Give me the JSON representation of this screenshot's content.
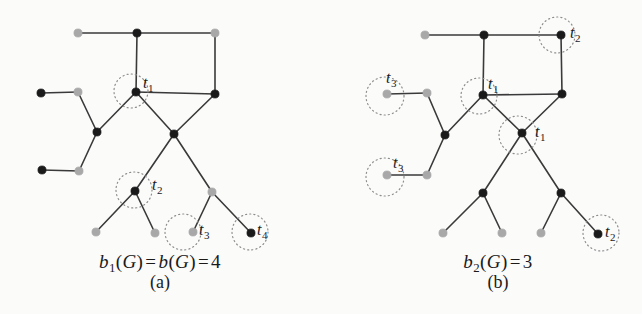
{
  "figure": {
    "background_color": "#fbfbfa",
    "node_dark_color": "#1a1a1a",
    "node_light_color": "#a8a8a8",
    "edge_color": "#3a3a3a",
    "circle_color": "#8d8d8d",
    "label_color": "#1a1a1a"
  },
  "panels": [
    {
      "id": "panel-a",
      "panel_label": "(a)",
      "formula": {
        "parts": [
          {
            "type": "var",
            "text": "b"
          },
          {
            "type": "sub",
            "text": "1"
          },
          {
            "type": "plain",
            "text": "("
          },
          {
            "type": "var",
            "text": "G"
          },
          {
            "type": "plain",
            "text": ")"
          },
          {
            "type": "op",
            "text": "="
          },
          {
            "type": "var",
            "text": "b"
          },
          {
            "type": "plain",
            "text": "("
          },
          {
            "type": "var",
            "text": "G"
          },
          {
            "type": "plain",
            "text": ")"
          },
          {
            "type": "op",
            "text": "="
          },
          {
            "type": "plain",
            "text": "4"
          }
        ],
        "plain_text": "b1(G) = b(G) = 4"
      },
      "formula_pos": {
        "x": 160,
        "y": 251
      },
      "label_pos": {
        "x": 160,
        "y": 272
      },
      "nodes": [
        {
          "id": "a-n1",
          "x": 78,
          "y": 33,
          "fill": "light"
        },
        {
          "id": "a-n2",
          "x": 137,
          "y": 33,
          "fill": "dark"
        },
        {
          "id": "a-n3",
          "x": 215,
          "y": 33,
          "fill": "light"
        },
        {
          "id": "a-n4",
          "x": 41,
          "y": 93,
          "fill": "dark"
        },
        {
          "id": "a-n5",
          "x": 78,
          "y": 92,
          "fill": "light"
        },
        {
          "id": "a-t1",
          "x": 136,
          "y": 92,
          "fill": "dark"
        },
        {
          "id": "a-n7",
          "x": 215,
          "y": 94,
          "fill": "dark"
        },
        {
          "id": "a-n8",
          "x": 97,
          "y": 132,
          "fill": "dark"
        },
        {
          "id": "a-n9",
          "x": 174,
          "y": 134,
          "fill": "dark"
        },
        {
          "id": "a-n10",
          "x": 42,
          "y": 170,
          "fill": "dark"
        },
        {
          "id": "a-n11",
          "x": 79,
          "y": 171,
          "fill": "light"
        },
        {
          "id": "a-t2",
          "x": 135,
          "y": 191,
          "fill": "dark"
        },
        {
          "id": "a-n13",
          "x": 212,
          "y": 192,
          "fill": "light"
        },
        {
          "id": "a-n14",
          "x": 96,
          "y": 232,
          "fill": "light"
        },
        {
          "id": "a-n15",
          "x": 155,
          "y": 233,
          "fill": "light"
        },
        {
          "id": "a-t3",
          "x": 193,
          "y": 232,
          "fill": "light"
        },
        {
          "id": "a-t4",
          "x": 251,
          "y": 233,
          "fill": "dark"
        }
      ],
      "edges": [
        [
          "a-n1",
          "a-n2"
        ],
        [
          "a-n2",
          "a-n3"
        ],
        [
          "a-n2",
          "a-t1"
        ],
        [
          "a-n3",
          "a-n7"
        ],
        [
          "a-t1",
          "a-n7"
        ],
        [
          "a-n4",
          "a-n5"
        ],
        [
          "a-n5",
          "a-n8"
        ],
        [
          "a-n8",
          "a-t1"
        ],
        [
          "a-n8",
          "a-n11"
        ],
        [
          "a-n10",
          "a-n11"
        ],
        [
          "a-t1",
          "a-n9"
        ],
        [
          "a-n7",
          "a-n9"
        ],
        [
          "a-n9",
          "a-t2"
        ],
        [
          "a-n9",
          "a-n13"
        ],
        [
          "a-t2",
          "a-n14"
        ],
        [
          "a-t2",
          "a-n15"
        ],
        [
          "a-n13",
          "a-t3"
        ],
        [
          "a-n13",
          "a-t4"
        ]
      ],
      "markers": [
        {
          "node": "a-t1",
          "cx": 131,
          "cy": 91,
          "r": 17,
          "label": "t",
          "sub": "1",
          "label_x": 143,
          "label_y": 77
        },
        {
          "node": "a-t2",
          "cx": 134,
          "cy": 190,
          "r": 18,
          "label": "t",
          "sub": "2",
          "label_x": 152,
          "label_y": 179
        },
        {
          "node": "a-t3",
          "cx": 183,
          "cy": 232,
          "r": 18,
          "label": "t",
          "sub": "3",
          "label_x": 199,
          "label_y": 224
        },
        {
          "node": "a-t4",
          "cx": 250,
          "cy": 232,
          "r": 18,
          "label": "t",
          "sub": "4",
          "label_x": 257,
          "label_y": 224
        }
      ]
    },
    {
      "id": "panel-b",
      "panel_label": "(b)",
      "formula": {
        "parts": [
          {
            "type": "var",
            "text": "b"
          },
          {
            "type": "sub",
            "text": "2"
          },
          {
            "type": "plain",
            "text": "("
          },
          {
            "type": "var",
            "text": "G"
          },
          {
            "type": "plain",
            "text": ")"
          },
          {
            "type": "op",
            "text": "="
          },
          {
            "type": "plain",
            "text": "3"
          }
        ],
        "plain_text": "b2(G) = 3"
      },
      "formula_pos": {
        "x": 498,
        "y": 251
      },
      "label_pos": {
        "x": 498,
        "y": 272
      },
      "nodes": [
        {
          "id": "b-n1",
          "x": 425,
          "y": 35,
          "fill": "light"
        },
        {
          "id": "b-n2",
          "x": 484,
          "y": 35,
          "fill": "dark"
        },
        {
          "id": "b-t2a",
          "x": 561,
          "y": 35,
          "fill": "dark"
        },
        {
          "id": "b-t3a",
          "x": 387,
          "y": 94,
          "fill": "light"
        },
        {
          "id": "b-n5",
          "x": 427,
          "y": 93,
          "fill": "light"
        },
        {
          "id": "b-t1a",
          "x": 483,
          "y": 95,
          "fill": "dark"
        },
        {
          "id": "b-n7",
          "x": 562,
          "y": 94,
          "fill": "dark"
        },
        {
          "id": "b-n8",
          "x": 445,
          "y": 135,
          "fill": "dark"
        },
        {
          "id": "b-t1b",
          "x": 522,
          "y": 133,
          "fill": "dark"
        },
        {
          "id": "b-t3b",
          "x": 387,
          "y": 175,
          "fill": "light"
        },
        {
          "id": "b-n11",
          "x": 427,
          "y": 175,
          "fill": "light"
        },
        {
          "id": "b-n12",
          "x": 483,
          "y": 193,
          "fill": "dark"
        },
        {
          "id": "b-n13",
          "x": 561,
          "y": 193,
          "fill": "dark"
        },
        {
          "id": "b-n14",
          "x": 443,
          "y": 233,
          "fill": "light"
        },
        {
          "id": "b-n15",
          "x": 502,
          "y": 233,
          "fill": "light"
        },
        {
          "id": "b-n16",
          "x": 541,
          "y": 233,
          "fill": "light"
        },
        {
          "id": "b-t2b",
          "x": 598,
          "y": 234,
          "fill": "dark"
        }
      ],
      "edges": [
        [
          "b-n1",
          "b-n2"
        ],
        [
          "b-n2",
          "b-t2a"
        ],
        [
          "b-n2",
          "b-t1a"
        ],
        [
          "b-t2a",
          "b-n7"
        ],
        [
          "b-t1a",
          "b-n7"
        ],
        [
          "b-t3a",
          "b-n5"
        ],
        [
          "b-n5",
          "b-n8"
        ],
        [
          "b-n8",
          "b-t1a"
        ],
        [
          "b-n8",
          "b-n11"
        ],
        [
          "b-t3b",
          "b-n11"
        ],
        [
          "b-t1a",
          "b-t1b"
        ],
        [
          "b-n7",
          "b-t1b"
        ],
        [
          "b-t1b",
          "b-n12"
        ],
        [
          "b-t1b",
          "b-n13"
        ],
        [
          "b-n12",
          "b-n14"
        ],
        [
          "b-n12",
          "b-n15"
        ],
        [
          "b-n13",
          "b-n16"
        ],
        [
          "b-n13",
          "b-t2b"
        ]
      ],
      "markers": [
        {
          "node": "b-t2a",
          "cx": 557,
          "cy": 35,
          "r": 18,
          "label": "t",
          "sub": "2",
          "label_x": 570,
          "label_y": 27
        },
        {
          "node": "b-t3a",
          "cx": 385,
          "cy": 96,
          "r": 19,
          "label": "t",
          "sub": "3",
          "label_x": 386,
          "label_y": 72
        },
        {
          "node": "b-t1a",
          "cx": 479,
          "cy": 96,
          "r": 18,
          "label": "t",
          "sub": "1",
          "label_x": 488,
          "label_y": 78
        },
        {
          "node": "b-t1b",
          "cx": 518,
          "cy": 135,
          "r": 19,
          "label": "t",
          "sub": "1",
          "label_x": 535,
          "label_y": 126
        },
        {
          "node": "b-t3b",
          "cx": 385,
          "cy": 177,
          "r": 19,
          "label": "t",
          "sub": "3",
          "label_x": 393,
          "label_y": 157
        },
        {
          "node": "b-t2b",
          "cx": 601,
          "cy": 233,
          "r": 18,
          "label": "t",
          "sub": "2",
          "label_x": 605,
          "label_y": 226
        }
      ]
    }
  ]
}
